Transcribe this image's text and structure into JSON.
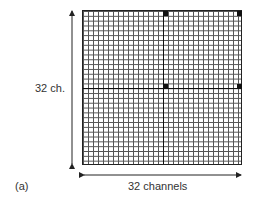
{
  "diagram": {
    "panel_label": "(a)",
    "vertical_label": "32 ch.",
    "horizontal_label": "32 channels",
    "grid": {
      "rows": 32,
      "cols": 32
    },
    "marked_cells": [
      {
        "row": 0,
        "col": 16
      },
      {
        "row": 0,
        "col": 31
      },
      {
        "row": 15,
        "col": 16
      },
      {
        "row": 15,
        "col": 31
      }
    ]
  }
}
